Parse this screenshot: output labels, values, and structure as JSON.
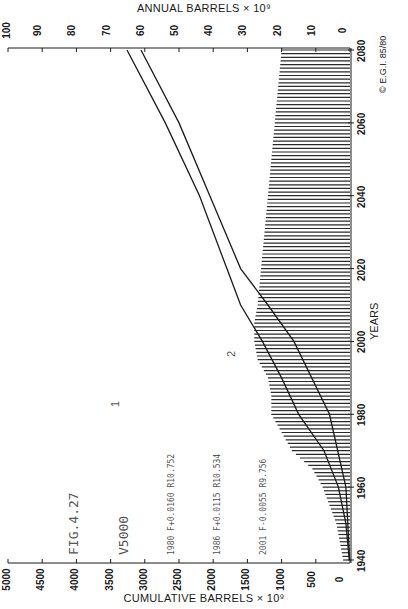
{
  "chart_data": {
    "type": "bar",
    "orientation": "rotated-90",
    "title": "",
    "top_axis_label": "ANNUAL  BARRELS × 10⁹",
    "bottom_axis_label": "CUMULATIVE  BARRELS × 10⁹",
    "xlabel": "YEARS",
    "annual_ticks": [
      "100",
      "90",
      "80",
      "70",
      "60",
      "50",
      "40",
      "30",
      "20",
      "10",
      "0"
    ],
    "cumulative_ticks": [
      "5000",
      "4500",
      "4000",
      "3500",
      "3000",
      "2500",
      "2000",
      "1500",
      "1000",
      "500",
      "0"
    ],
    "year_ticks": [
      "1940",
      "1960",
      "1980",
      "2000",
      "2020",
      "2040",
      "2060",
      "2080"
    ],
    "annual_range": [
      0,
      100
    ],
    "cumulative_range": [
      0,
      5000
    ],
    "year_range": [
      1940,
      2080
    ],
    "bars": {
      "name": "Annual production (hatched)",
      "x": [
        1940,
        1945,
        1950,
        1955,
        1960,
        1965,
        1970,
        1975,
        1980,
        1985,
        1990,
        1995,
        2000,
        2005,
        2010,
        2020,
        2030,
        2040,
        2050,
        2060,
        2070,
        2080
      ],
      "values": [
        2,
        3,
        4,
        6,
        8,
        11,
        17,
        20,
        23,
        23,
        24,
        27,
        28,
        28,
        27,
        26,
        25,
        24,
        23,
        22,
        21,
        20
      ]
    },
    "series": [
      {
        "name": "1",
        "x": [
          1940,
          1950,
          1960,
          1970,
          1980,
          1990,
          2000,
          2010,
          2020,
          2040,
          2060,
          2080
        ],
        "values": [
          10,
          60,
          170,
          380,
          750,
          1000,
          1280,
          1600,
          1800,
          2200,
          2700,
          3260
        ]
      },
      {
        "name": "2",
        "x": [
          1940,
          1960,
          1980,
          2000,
          2010,
          2020,
          2040,
          2060,
          2080
        ],
        "values": [
          5,
          60,
          300,
          820,
          1200,
          1600,
          2050,
          2500,
          3055
        ]
      }
    ],
    "annotations": {
      "fig": "FIG.4.27",
      "v": "V5000",
      "lines": [
        "1980 F+0.0160 R10.752",
        "1986 F+0.0115 R10.534",
        "2001 F-0.0055 R9.756"
      ],
      "copyright": "© E.G.I. 85/80"
    },
    "grid": false
  },
  "labels": {
    "top_axis": "ANNUAL  BARRELS × 10⁹",
    "bottom_axis": "CUMULATIVE  BARRELS × 10⁹",
    "years": "YEARS",
    "fig": "FIG.4.27",
    "v": "V5000",
    "line1": "1980 F+0.0160 R10.752",
    "line2": "1986 F+0.0115 R10.534",
    "line3": "2001 F-0.0055 R9.756",
    "copyright": "© E.G.I. 85/80",
    "curve1": "1",
    "curve2": "2"
  },
  "colors": {
    "ink": "#1a1a1a",
    "hatch": "#2a2a2a",
    "annotation": "#555555",
    "background": "#ffffff"
  }
}
